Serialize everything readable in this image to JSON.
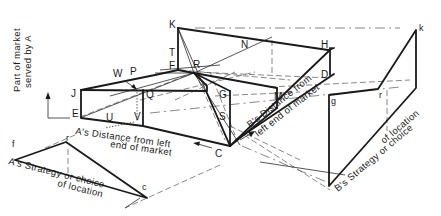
{
  "diagram": {
    "y_axis_label": {
      "line1": "Part of market",
      "line2": "served by A"
    },
    "axis_labels": {
      "a_distance_line1": "A's Distance from left",
      "a_distance_line2": "end of market",
      "b_distance_line1": "B's Distance from",
      "b_distance_line2": "left end of market",
      "a_strategy_line1": "A's Strategy or choice",
      "a_strategy_line2": "of location",
      "b_strategy_line1": "B's Strategy or choice",
      "b_strategy_line2": "of location"
    },
    "point_labels": {
      "K": "K",
      "T": "T",
      "F": "F",
      "R": "R",
      "N": "N",
      "H": "H",
      "D": "D",
      "W": "W",
      "P": "P",
      "J": "J",
      "Q": "Q",
      "G": "G",
      "M": "M",
      "E": "E",
      "U": "U",
      "V": "V",
      "S": "S",
      "C": "C",
      "f": "f",
      "r_left": "r",
      "c": "c",
      "g": "g",
      "r_right": "r",
      "k": "k"
    }
  }
}
